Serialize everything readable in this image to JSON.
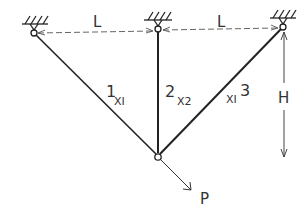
{
  "diagram": {
    "type": "three-bar truss",
    "dimension_labels": {
      "span_left": "L",
      "span_right": "L",
      "height": "H"
    },
    "members": [
      {
        "number": "1",
        "variable": "XI"
      },
      {
        "number": "2",
        "variable": "X2"
      },
      {
        "number": "3",
        "variable": "XI"
      }
    ],
    "load": {
      "label": "P"
    },
    "colors": {
      "line": "#222222",
      "text": "#333333",
      "background": "#ffffff"
    }
  }
}
